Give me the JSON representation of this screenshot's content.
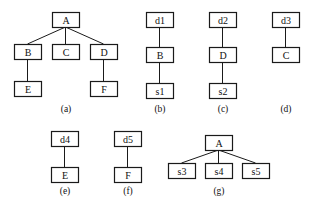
{
  "diagrams": [
    {
      "id": "a",
      "caption": "(a)",
      "nodes": [
        "A",
        "B",
        "C",
        "D",
        "E",
        "F"
      ],
      "edges": [
        [
          "A",
          "B"
        ],
        [
          "A",
          "C"
        ],
        [
          "A",
          "D"
        ],
        [
          "B",
          "E"
        ],
        [
          "D",
          "F"
        ]
      ]
    },
    {
      "id": "b",
      "caption": "(b)",
      "nodes": [
        "d1",
        "B",
        "s1"
      ],
      "edges": [
        [
          "d1",
          "B"
        ],
        [
          "B",
          "s1"
        ]
      ]
    },
    {
      "id": "c",
      "caption": "(c)",
      "nodes": [
        "d2",
        "D",
        "s2"
      ],
      "edges": [
        [
          "d2",
          "D"
        ],
        [
          "D",
          "s2"
        ]
      ]
    },
    {
      "id": "d",
      "caption": "(d)",
      "nodes": [
        "d3",
        "C"
      ],
      "edges": [
        [
          "d3",
          "C"
        ]
      ]
    },
    {
      "id": "e",
      "caption": "(e)",
      "nodes": [
        "d4",
        "E"
      ],
      "edges": [
        [
          "d4",
          "E"
        ]
      ]
    },
    {
      "id": "f",
      "caption": "(f)",
      "nodes": [
        "d5",
        "F"
      ],
      "edges": [
        [
          "d5",
          "F"
        ]
      ]
    },
    {
      "id": "g",
      "caption": "(g)",
      "nodes": [
        "A",
        "s3",
        "s4",
        "s5"
      ],
      "edges": [
        [
          "A",
          "s3"
        ],
        [
          "A",
          "s4"
        ],
        [
          "A",
          "s5"
        ]
      ]
    }
  ]
}
